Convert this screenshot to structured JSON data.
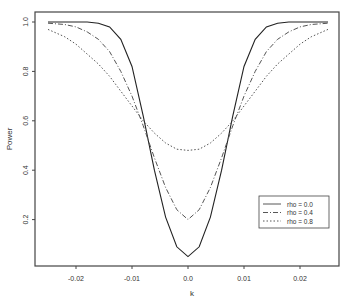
{
  "chart_data": {
    "type": "line",
    "title": "",
    "xlabel": "k",
    "ylabel": "Power",
    "xlim": [
      -0.026,
      0.025
    ],
    "ylim": [
      0.0,
      1.03
    ],
    "grid": false,
    "legend_position": "lower right (inside)",
    "x_ticks": [
      -0.02,
      -0.01,
      0.0,
      0.01,
      0.02
    ],
    "x_tick_labels": [
      "-0.02",
      "-0.01",
      "0.0",
      "0.01",
      "0.02"
    ],
    "y_ticks": [
      0.2,
      0.4,
      0.6,
      0.8,
      1.0
    ],
    "y_tick_labels": [
      "0.2",
      "0.4",
      "0.6",
      "0.8",
      "1.0"
    ],
    "x": [
      -0.025,
      -0.022,
      -0.02,
      -0.018,
      -0.016,
      -0.014,
      -0.012,
      -0.01,
      -0.008,
      -0.006,
      -0.004,
      -0.002,
      0.0,
      0.002,
      0.004,
      0.006,
      0.008,
      0.01,
      0.012,
      0.014,
      0.016,
      0.018,
      0.02,
      0.022,
      0.025
    ],
    "series": [
      {
        "name": "rho = 0.0",
        "style": "solid",
        "values": [
          1.0,
          1.0,
          1.0,
          1.0,
          0.995,
          0.98,
          0.93,
          0.82,
          0.62,
          0.4,
          0.21,
          0.09,
          0.05,
          0.09,
          0.21,
          0.4,
          0.62,
          0.82,
          0.93,
          0.98,
          0.995,
          1.0,
          1.0,
          1.0,
          1.0
        ]
      },
      {
        "name": "rho = 0.4",
        "style": "dashdot",
        "values": [
          0.995,
          0.99,
          0.98,
          0.96,
          0.93,
          0.88,
          0.8,
          0.7,
          0.58,
          0.45,
          0.33,
          0.24,
          0.2,
          0.24,
          0.33,
          0.45,
          0.58,
          0.7,
          0.8,
          0.88,
          0.93,
          0.96,
          0.98,
          0.99,
          0.995
        ]
      },
      {
        "name": "rho = 0.8",
        "style": "dotted",
        "values": [
          0.97,
          0.94,
          0.91,
          0.87,
          0.83,
          0.78,
          0.72,
          0.66,
          0.6,
          0.55,
          0.51,
          0.485,
          0.48,
          0.485,
          0.51,
          0.55,
          0.6,
          0.66,
          0.72,
          0.78,
          0.83,
          0.87,
          0.91,
          0.94,
          0.97
        ]
      }
    ]
  }
}
